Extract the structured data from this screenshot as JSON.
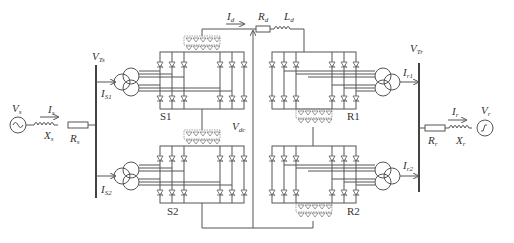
{
  "diagram": {
    "colors": {
      "line": "#555555",
      "text": "#333333",
      "background": "#ffffff"
    },
    "sending_side": {
      "source_label": "V",
      "source_sub": "s",
      "current_label": "I",
      "current_sub": "s",
      "reactance_label": "X",
      "reactance_sub": "s",
      "resistance_label": "R",
      "resistance_sub": "s",
      "bus_voltage_label": "V",
      "bus_voltage_sub": "Ts",
      "transformer_currents": [
        {
          "label": "I",
          "sub": "S1"
        },
        {
          "label": "I",
          "sub": "S2"
        }
      ],
      "bridges": [
        "S1",
        "S2"
      ]
    },
    "dc_link": {
      "current_label": "I",
      "current_sub": "d",
      "resistance_label": "R",
      "resistance_sub": "d",
      "inductance_label": "L",
      "inductance_sub": "d",
      "voltage_label": "V",
      "voltage_sub": "dc"
    },
    "receiving_side": {
      "source_label": "V",
      "source_sub": "r",
      "current_label": "I",
      "current_sub": "r",
      "reactance_label": "X",
      "reactance_sub": "r",
      "resistance_label": "R",
      "resistance_sub": "r",
      "bus_voltage_label": "V",
      "bus_voltage_sub": "Tr",
      "transformer_currents": [
        {
          "label": "I",
          "sub": "r1"
        },
        {
          "label": "I",
          "sub": "r2"
        }
      ],
      "bridges": [
        "R1",
        "R2"
      ]
    }
  }
}
